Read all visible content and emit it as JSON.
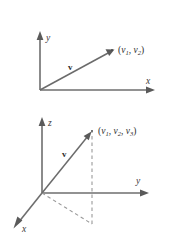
{
  "figure": {
    "background_color": "#ffffff",
    "axis_color": "#6e6e6e",
    "vector_color": "#6b6b6b",
    "dash_color": "#9a9a9a",
    "text_color": "#2e2e2e"
  },
  "panel_2d": {
    "name": "two-dimensional-vector-diagram",
    "axes": [
      {
        "id": "y",
        "label": "y"
      },
      {
        "id": "x",
        "label": "x"
      }
    ],
    "vector": {
      "label": "v"
    },
    "point": {
      "open_paren": "(",
      "component_1_base": "v",
      "component_1_sub": "1",
      "comma_1": ", ",
      "component_2_base": "v",
      "component_2_sub": "2",
      "close_paren": ")"
    }
  },
  "panel_3d": {
    "name": "three-dimensional-vector-diagram",
    "axes": [
      {
        "id": "z",
        "label": "z"
      },
      {
        "id": "y",
        "label": "y"
      },
      {
        "id": "x",
        "label": "x"
      }
    ],
    "vector": {
      "label": "v"
    },
    "point": {
      "open_paren": "(",
      "component_1_base": "v",
      "component_1_sub": "1",
      "comma_1": ", ",
      "component_2_base": "v",
      "component_2_sub": "2",
      "comma_2": ", ",
      "component_3_base": "v",
      "component_3_sub": "3",
      "close_paren": ")"
    }
  }
}
